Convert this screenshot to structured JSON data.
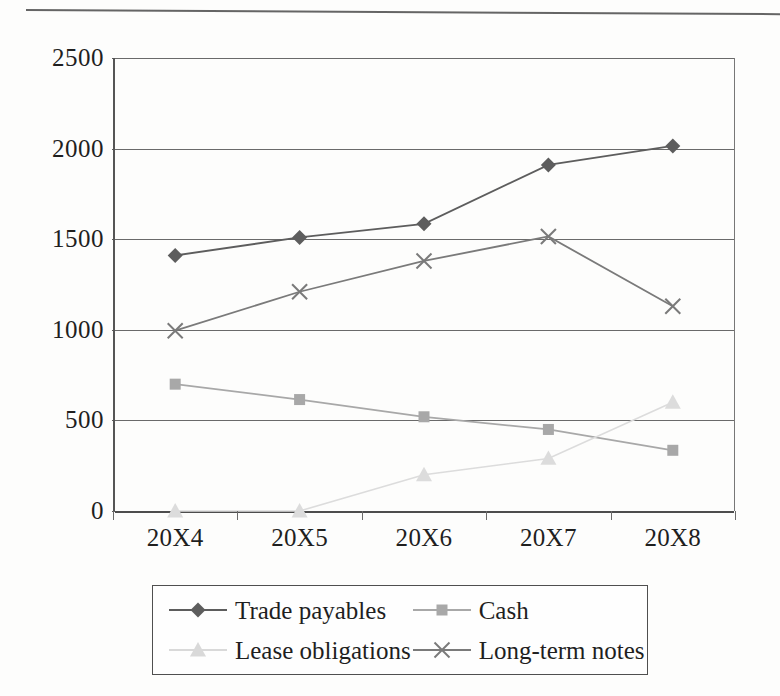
{
  "figure": {
    "top_rule": "horizontal-rule"
  },
  "axes": {
    "y_ticks": [
      "2500",
      "2000",
      "1500",
      "1000",
      "500",
      "0"
    ],
    "x_ticks": [
      "20X4",
      "20X5",
      "20X6",
      "20X7",
      "20X8"
    ]
  },
  "legend": {
    "entries": [
      {
        "label": "Trade payables",
        "marker": "diamond",
        "color": "#5d5d5d"
      },
      {
        "label": "Cash",
        "marker": "square",
        "color": "#a8a8a8"
      },
      {
        "label": "Lease obligations",
        "marker": "triangle",
        "color": "#d9d9d9"
      },
      {
        "label": "Long-term notes",
        "marker": "cross",
        "color": "#7a7a7a"
      }
    ]
  },
  "chart_data": {
    "type": "line",
    "title": "",
    "xlabel": "",
    "ylabel": "",
    "categories": [
      "20X4",
      "20X5",
      "20X6",
      "20X7",
      "20X8"
    ],
    "ylim": [
      0,
      2500
    ],
    "ytick_step": 500,
    "grid": true,
    "legend_position": "bottom",
    "series": [
      {
        "name": "Trade payables",
        "marker": "diamond",
        "color": "#5d5d5d",
        "values": [
          1410,
          1510,
          1585,
          1910,
          2015
        ]
      },
      {
        "name": "Cash",
        "marker": "square",
        "color": "#a8a8a8",
        "values": [
          700,
          615,
          520,
          450,
          335
        ]
      },
      {
        "name": "Lease obligations",
        "marker": "triangle",
        "color": "#dcdcdc",
        "values": [
          0,
          0,
          200,
          290,
          600
        ]
      },
      {
        "name": "Long-term notes",
        "marker": "cross",
        "color": "#7a7a7a",
        "values": [
          995,
          1210,
          1380,
          1515,
          1130
        ]
      }
    ]
  }
}
